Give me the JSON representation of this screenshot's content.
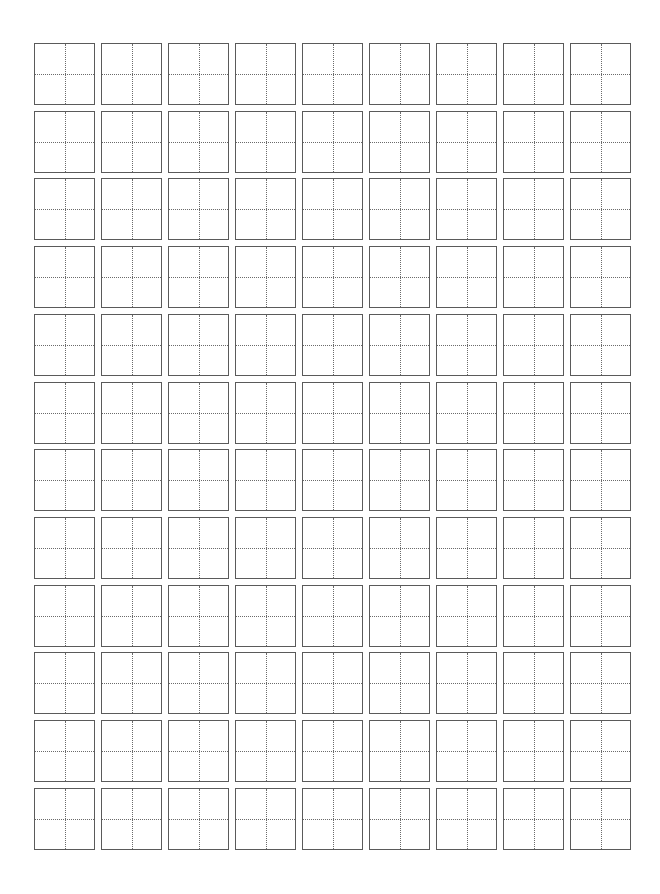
{
  "worksheet": {
    "type": "tian-zi-ge practice grid",
    "rows": 12,
    "columns": 9,
    "origin_x": 34,
    "origin_y": 43,
    "col_pitch": 67,
    "row_pitch": 67.7,
    "cell_size": 60,
    "colors": {
      "background": "#ffffff",
      "border": "#5a5a5a",
      "guide": "#6a6a6a"
    },
    "cell_content": ""
  }
}
